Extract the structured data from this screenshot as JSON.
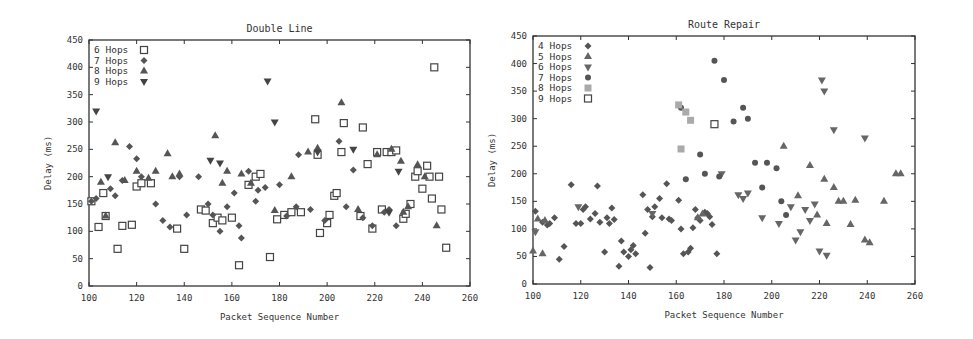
{
  "chart_data": [
    {
      "type": "scatter",
      "title": "Double Line",
      "xlabel": "Packet Sequence Number",
      "ylabel": "Delay (ms)",
      "xlim": [
        100,
        260
      ],
      "ylim": [
        0,
        450
      ],
      "xticks": [
        100,
        120,
        140,
        160,
        180,
        200,
        220,
        240,
        260
      ],
      "yticks": [
        0,
        50,
        100,
        150,
        200,
        250,
        300,
        350,
        400,
        450
      ],
      "grid": false,
      "legend_position": "top-left",
      "series": [
        {
          "name": "6 Hops",
          "marker": "open-square",
          "color": "#444444",
          "points": [
            [
              101,
              155
            ],
            [
              104,
              108
            ],
            [
              106,
              170
            ],
            [
              107,
              128
            ],
            [
              112,
              68
            ],
            [
              114,
              110
            ],
            [
              118,
              112
            ],
            [
              120,
              182
            ],
            [
              122,
              188
            ],
            [
              126,
              188
            ],
            [
              137,
              105
            ],
            [
              140,
              68
            ],
            [
              147,
              140
            ],
            [
              149,
              138
            ],
            [
              152,
              115
            ],
            [
              154,
              125
            ],
            [
              156,
              120
            ],
            [
              160,
              125
            ],
            [
              163,
              38
            ],
            [
              167,
              185
            ],
            [
              170,
              200
            ],
            [
              172,
              205
            ],
            [
              176,
              53
            ],
            [
              179,
              122
            ],
            [
              182,
              130
            ],
            [
              185,
              135
            ],
            [
              189,
              135
            ],
            [
              195,
              305
            ],
            [
              196,
              240
            ],
            [
              197,
              97
            ],
            [
              200,
              115
            ],
            [
              201,
              130
            ],
            [
              203,
              165
            ],
            [
              204,
              170
            ],
            [
              206,
              245
            ],
            [
              207,
              298
            ],
            [
              214,
              128
            ],
            [
              215,
              290
            ],
            [
              217,
              223
            ],
            [
              219,
              105
            ],
            [
              221,
              245
            ],
            [
              223,
              140
            ],
            [
              225,
              245
            ],
            [
              227,
              245
            ],
            [
              229,
              248
            ],
            [
              232,
              123
            ],
            [
              233,
              132
            ],
            [
              235,
              150
            ],
            [
              237,
              200
            ],
            [
              238,
              210
            ],
            [
              240,
              178
            ],
            [
              242,
              220
            ],
            [
              243,
              200
            ],
            [
              244,
              160
            ],
            [
              245,
              400
            ],
            [
              247,
              200
            ],
            [
              248,
              140
            ],
            [
              250,
              70
            ]
          ]
        },
        {
          "name": "7 Hops",
          "marker": "diamond",
          "color": "#555555",
          "points": [
            [
              101,
              155
            ],
            [
              103,
              160
            ],
            [
              109,
              178
            ],
            [
              111,
              165
            ],
            [
              114,
              193
            ],
            [
              117,
              255
            ],
            [
              120,
              233
            ],
            [
              122,
              200
            ],
            [
              128,
              150
            ],
            [
              131,
              120
            ],
            [
              134,
              108
            ],
            [
              138,
              200
            ],
            [
              141,
              130
            ],
            [
              146,
              200
            ],
            [
              150,
              150
            ],
            [
              152,
              130
            ],
            [
              155,
              100
            ],
            [
              158,
              145
            ],
            [
              161,
              170
            ],
            [
              163,
              110
            ],
            [
              164,
              88
            ],
            [
              167,
              210
            ],
            [
              170,
              155
            ],
            [
              171,
              175
            ],
            [
              174,
              180
            ],
            [
              180,
              185
            ],
            [
              183,
              128
            ],
            [
              187,
              145
            ],
            [
              188,
              240
            ],
            [
              193,
              140
            ],
            [
              199,
              120
            ],
            [
              205,
              265
            ],
            [
              208,
              145
            ],
            [
              211,
              212
            ],
            [
              215,
              125
            ],
            [
              219,
              110
            ],
            [
              224,
              135
            ],
            [
              226,
              140
            ],
            [
              229,
              110
            ]
          ]
        },
        {
          "name": "8 Hops",
          "marker": "triangle-up",
          "color": "#555555",
          "points": [
            [
              105,
              190
            ],
            [
              107,
              128
            ],
            [
              111,
              262
            ],
            [
              115,
              193
            ],
            [
              120,
              210
            ],
            [
              125,
              197
            ],
            [
              128,
              210
            ],
            [
              133,
              242
            ],
            [
              135,
              200
            ],
            [
              138,
              205
            ],
            [
              153,
              275
            ],
            [
              156,
              188
            ],
            [
              158,
              210
            ],
            [
              164,
              205
            ],
            [
              168,
              188
            ],
            [
              178,
              138
            ],
            [
              185,
              200
            ],
            [
              192,
              245
            ],
            [
              196,
              252
            ],
            [
              206,
              335
            ],
            [
              213,
              140
            ],
            [
              221,
              240
            ],
            [
              227,
              250
            ],
            [
              231,
              228
            ],
            [
              232,
              135
            ],
            [
              234,
              145
            ],
            [
              238,
              222
            ],
            [
              241,
              200
            ],
            [
              246,
              110
            ]
          ]
        },
        {
          "name": "9 Hops",
          "marker": "triangle-down",
          "color": "#444444",
          "points": [
            [
              103,
              320
            ],
            [
              108,
              200
            ],
            [
              151,
              230
            ],
            [
              155,
              225
            ],
            [
              175,
              375
            ],
            [
              178,
              300
            ],
            [
              196,
              245
            ],
            [
              211,
              250
            ],
            [
              226,
              135
            ],
            [
              230,
              210
            ]
          ]
        }
      ]
    },
    {
      "type": "scatter",
      "title": "Route Repair",
      "xlabel": "Packet Sequence Number",
      "ylabel": "Delay (ms)",
      "xlim": [
        100,
        260
      ],
      "ylim": [
        0,
        450
      ],
      "xticks": [
        100,
        120,
        140,
        160,
        180,
        200,
        220,
        240,
        260
      ],
      "yticks": [
        0,
        50,
        100,
        150,
        200,
        250,
        300,
        350,
        400,
        450
      ],
      "grid": false,
      "legend_position": "top-left",
      "series": [
        {
          "name": "4 Hops",
          "marker": "diamond",
          "color": "#555555",
          "points": [
            [
              101,
              132
            ],
            [
              104,
              112
            ],
            [
              106,
              107
            ],
            [
              107,
              110
            ],
            [
              109,
              120
            ],
            [
              111,
              45
            ],
            [
              113,
              68
            ],
            [
              116,
              180
            ],
            [
              118,
              110
            ],
            [
              120,
              110
            ],
            [
              121,
              135
            ],
            [
              122,
              140
            ],
            [
              124,
              118
            ],
            [
              126,
              128
            ],
            [
              127,
              178
            ],
            [
              128,
              112
            ],
            [
              130,
              58
            ],
            [
              131,
              120
            ],
            [
              132,
              110
            ],
            [
              133,
              138
            ],
            [
              134,
              117
            ],
            [
              136,
              32
            ],
            [
              137,
              78
            ],
            [
              138,
              58
            ],
            [
              140,
              50
            ],
            [
              141,
              62
            ],
            [
              142,
              70
            ],
            [
              143,
              55
            ],
            [
              146,
              162
            ],
            [
              147,
              92
            ],
            [
              148,
              135
            ],
            [
              149,
              30
            ],
            [
              150,
              122
            ],
            [
              151,
              140
            ],
            [
              153,
              155
            ],
            [
              154,
              120
            ],
            [
              156,
              182
            ],
            [
              157,
              118
            ],
            [
              158,
              115
            ],
            [
              161,
              152
            ],
            [
              162,
              100
            ],
            [
              163,
              55
            ],
            [
              165,
              58
            ],
            [
              166,
              65
            ],
            [
              167,
              102
            ],
            [
              168,
              135
            ],
            [
              169,
              120
            ],
            [
              170,
              115
            ],
            [
              172,
              130
            ],
            [
              173,
              128
            ],
            [
              174,
              122
            ],
            [
              175,
              108
            ],
            [
              177,
              55
            ]
          ]
        },
        {
          "name": "5 Hops",
          "marker": "triangle-up",
          "color": "#666666",
          "points": [
            [
              100,
              60
            ],
            [
              102,
              118
            ],
            [
              104,
              55
            ],
            [
              105,
              115
            ],
            [
              169,
              120
            ],
            [
              171,
              127
            ],
            [
              205,
              250
            ],
            [
              211,
              160
            ],
            [
              216,
              215
            ],
            [
              219,
              125
            ],
            [
              222,
              190
            ],
            [
              223,
              110
            ],
            [
              226,
              175
            ],
            [
              228,
              150
            ],
            [
              230,
              150
            ],
            [
              233,
              108
            ],
            [
              235,
              152
            ],
            [
              239,
              80
            ],
            [
              241,
              75
            ],
            [
              247,
              150
            ],
            [
              252,
              200
            ],
            [
              254,
              200
            ]
          ]
        },
        {
          "name": "6 Hops",
          "marker": "triangle-down",
          "color": "#666666",
          "points": [
            [
              101,
              95
            ],
            [
              119,
              140
            ],
            [
              150,
              128
            ],
            [
              179,
              200
            ],
            [
              186,
              162
            ],
            [
              188,
              155
            ],
            [
              190,
              165
            ],
            [
              196,
              120
            ],
            [
              203,
              110
            ],
            [
              208,
              140
            ],
            [
              210,
              80
            ],
            [
              212,
              95
            ],
            [
              214,
              135
            ],
            [
              216,
              115
            ],
            [
              218,
              145
            ],
            [
              220,
              60
            ],
            [
              221,
              370
            ],
            [
              222,
              350
            ],
            [
              223,
              52
            ],
            [
              226,
              280
            ],
            [
              239,
              265
            ]
          ]
        },
        {
          "name": "7 Hops",
          "marker": "circle",
          "color": "#555555",
          "points": [
            [
              162,
              320
            ],
            [
              164,
              190
            ],
            [
              170,
              235
            ],
            [
              172,
              200
            ],
            [
              176,
              405
            ],
            [
              178,
              195
            ],
            [
              180,
              370
            ],
            [
              184,
              295
            ],
            [
              188,
              320
            ],
            [
              190,
              300
            ],
            [
              193,
              220
            ],
            [
              196,
              175
            ],
            [
              198,
              220
            ],
            [
              202,
              210
            ],
            [
              204,
              150
            ],
            [
              206,
              125
            ]
          ]
        },
        {
          "name": "8 Hops",
          "marker": "filled-square",
          "color": "#aaaaaa",
          "points": [
            [
              161,
              325
            ],
            [
              164,
              312
            ],
            [
              166,
              297
            ],
            [
              162,
              245
            ]
          ]
        },
        {
          "name": "9 Hops",
          "marker": "open-square",
          "color": "#444444",
          "points": [
            [
              176,
              290
            ]
          ]
        }
      ]
    }
  ]
}
